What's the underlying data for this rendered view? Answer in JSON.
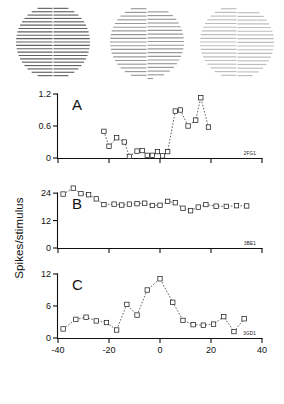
{
  "figure": {
    "ylabel": "Spikes/stimulus",
    "xlabel": "Alignment (min arc)"
  },
  "stimuli": [
    {
      "name": "stimulus-aligned",
      "offset": 0,
      "lines": 21,
      "contrast": 0.62
    },
    {
      "name": "stimulus-offset-mid",
      "offset": 3.2,
      "lines": 19,
      "contrast": 0.4
    },
    {
      "name": "stimulus-offset-large",
      "offset": 4.0,
      "lines": 19,
      "contrast": 0.26
    }
  ],
  "chart_data": [
    {
      "type": "line",
      "panel": "A",
      "cell_id": "2FG1",
      "title": "A",
      "xlabel": "Alignment (min arc)",
      "ylabel": "Spikes/stimulus",
      "xlim": [
        -40,
        40
      ],
      "ylim": [
        0,
        1.2
      ],
      "xticks": [
        -40,
        -20,
        0,
        20,
        40
      ],
      "yticks": [
        0,
        0.6,
        1.2
      ],
      "ytick_labels": [
        "0",
        "0.6",
        "1.2"
      ],
      "grid": false,
      "marker": "open-square",
      "linestyle": "dashed",
      "x": [
        -22,
        -20,
        -17,
        -14,
        -12,
        -9,
        -7,
        -5,
        -3,
        -1,
        1,
        3,
        6,
        8,
        11,
        14,
        16,
        19
      ],
      "y": [
        0.5,
        0.22,
        0.38,
        0.3,
        0.03,
        0.13,
        0.14,
        0.05,
        0.05,
        0.12,
        0.04,
        0.12,
        0.88,
        0.9,
        0.6,
        0.71,
        1.13,
        0.58
      ]
    },
    {
      "type": "line",
      "panel": "B",
      "cell_id": "3BE1",
      "title": "B",
      "xlabel": "Alignment (min arc)",
      "ylabel": "Spikes/stimulus",
      "xlim": [
        -40,
        40
      ],
      "ylim": [
        0,
        28
      ],
      "xticks": [
        -40,
        -20,
        0,
        20,
        40
      ],
      "yticks": [
        0,
        12,
        24
      ],
      "ytick_labels": [
        "0",
        "12",
        "24"
      ],
      "grid": false,
      "marker": "open-square",
      "linestyle": "dashed",
      "x": [
        -38,
        -34,
        -31,
        -28,
        -25,
        -22,
        -18,
        -15,
        -12,
        -9,
        -6,
        -3,
        0,
        3,
        6,
        9,
        12,
        15,
        18,
        22,
        26,
        30,
        34
      ],
      "y": [
        23.6,
        26.2,
        23.8,
        23.3,
        21.5,
        19.0,
        19.2,
        18.8,
        19.2,
        19.4,
        19.6,
        18.6,
        18.7,
        20.4,
        19.8,
        17.4,
        16.3,
        17.9,
        19.0,
        18.3,
        18.2,
        18.5,
        18.4
      ]
    },
    {
      "type": "line",
      "panel": "C",
      "cell_id": "3GD1",
      "title": "C",
      "xlabel": "Alignment (min arc)",
      "ylabel": "Spikes/stimulus",
      "xlim": [
        -40,
        40
      ],
      "ylim": [
        0,
        12
      ],
      "xticks": [
        -40,
        -20,
        0,
        20,
        40
      ],
      "yticks": [
        0,
        6,
        12
      ],
      "ytick_labels": [
        "0",
        "6",
        "12"
      ],
      "grid": false,
      "marker": "open-square",
      "linestyle": "dashed",
      "x": [
        -38,
        -33,
        -29,
        -25,
        -21,
        -17,
        -13,
        -9,
        -5,
        0,
        5,
        9,
        13,
        17,
        21,
        25,
        29,
        33
      ],
      "y": [
        1.7,
        3.5,
        3.9,
        3.2,
        2.9,
        1.5,
        6.3,
        4.3,
        9.0,
        11.1,
        6.7,
        3.3,
        2.5,
        2.4,
        2.6,
        4.0,
        1.2,
        3.6
      ]
    }
  ]
}
